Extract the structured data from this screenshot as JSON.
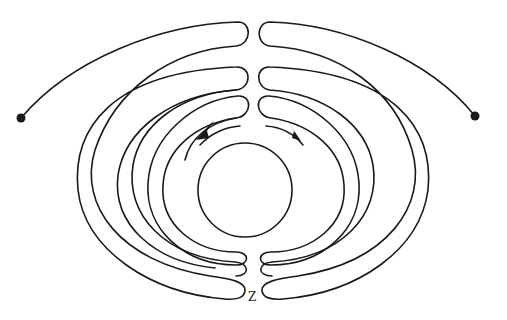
{
  "diagram": {
    "type": "labyrinth path diagram",
    "labels": {
      "bottom_gap": "Z"
    },
    "elements": {
      "left_endpoint": "filled dot",
      "right_endpoint": "filled dot",
      "center": "circle",
      "arrows": [
        "counter-clockwise arrow (left)",
        "clockwise arrow (right)"
      ]
    },
    "colors": {
      "stroke": "#1a1a1a",
      "background": "#ffffff"
    }
  }
}
